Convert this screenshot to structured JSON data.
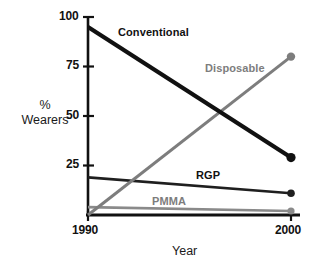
{
  "chart_data": {
    "type": "line",
    "title": "",
    "xlabel": "Year",
    "ylabel": "% Wearers",
    "ylabel_line1": "%",
    "ylabel_line2": "Wearers",
    "x": [
      1990,
      2000
    ],
    "xlim": [
      1990,
      2000
    ],
    "ylim": [
      0,
      100
    ],
    "xticks": [
      1990,
      2000
    ],
    "xtick_labels": [
      "1990",
      "2000"
    ],
    "yticks": [
      0,
      25,
      50,
      75,
      100
    ],
    "ytick_labels": [
      "25",
      "50",
      "75",
      "100"
    ],
    "grid": false,
    "legend_position": "inline-labels",
    "series": [
      {
        "name": "Conventional",
        "label": "Conventional",
        "values": [
          95,
          29
        ],
        "color": "#111111",
        "width": 4.2,
        "marker": "circle",
        "marker_end_only": true,
        "label_color": "#111111"
      },
      {
        "name": "Disposable",
        "label": "Disposable",
        "values": [
          0,
          80
        ],
        "color": "#7d7d7d",
        "width": 3.0,
        "marker": "circle",
        "marker_end_only": true,
        "label_color": "#7d7d7d"
      },
      {
        "name": "RGP",
        "label": "RGP",
        "values": [
          19,
          11
        ],
        "color": "#1f1f1f",
        "width": 2.6,
        "marker": "circle",
        "marker_end_only": true,
        "label_color": "#111111"
      },
      {
        "name": "PMMA",
        "label": "PMMA",
        "values": [
          4,
          2
        ],
        "color": "#8a8a8a",
        "width": 2.6,
        "marker": "circle",
        "marker_end_only": true,
        "label_color": "#7d7d7d"
      }
    ]
  },
  "axis": {
    "y_tick_100": "100",
    "y_tick_75": "75",
    "y_tick_50": "50",
    "y_tick_25": "25",
    "x_tick_left": "1990",
    "x_tick_right": "2000",
    "x_axis_title": "Year",
    "y_axis_title_line1": "%",
    "y_axis_title_line2": "Wearers"
  },
  "labels": {
    "conventional": "Conventional",
    "disposable": "Disposable",
    "rgp": "RGP",
    "pmma": "PMMA"
  },
  "colors": {
    "black": "#111111",
    "gray": "#7d7d7d",
    "background": "#ffffff"
  }
}
